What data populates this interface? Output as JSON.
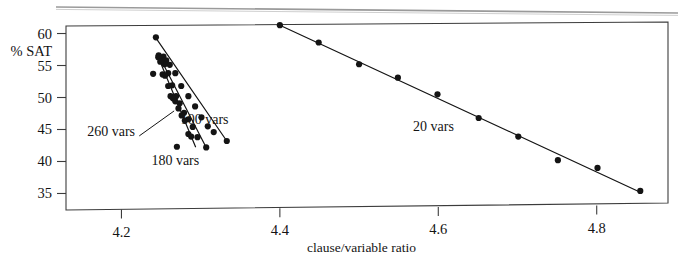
{
  "figure": {
    "name": "sat-vs-clause-variable-ratio-plot",
    "background": "#ffffff",
    "ink_color": "#141414"
  },
  "axes": {
    "x": {
      "label": "clause/variable ratio",
      "ticks": [
        "4.2",
        "4.4",
        "4.6",
        "4.8"
      ],
      "tick_values": [
        4.2,
        4.4,
        4.6,
        4.8
      ],
      "range": [
        4.13,
        4.89
      ]
    },
    "y": {
      "label": "% SAT",
      "ticks": [
        "60",
        "55",
        "50",
        "45",
        "40",
        "35"
      ],
      "tick_values": [
        60,
        55,
        50,
        45,
        40,
        35
      ],
      "range": [
        33.2,
        61.8
      ]
    }
  },
  "series_labels": [
    {
      "text": "100 vars",
      "x": 4.305,
      "y": 46.6
    },
    {
      "text": "260 vars",
      "x": 4.187,
      "y": 44.8
    },
    {
      "text": "180 vars",
      "x": 4.268,
      "y": 40.3
    },
    {
      "text": "20 vars",
      "x": 4.594,
      "y": 45.6
    }
  ],
  "chart_data": {
    "type": "scatter",
    "title": "",
    "xlabel": "clause/variable ratio",
    "ylabel": "% SAT",
    "xlim": [
      4.13,
      4.89
    ],
    "ylim": [
      33.2,
      61.8
    ],
    "grid": false,
    "legend": "inline-annotations",
    "series": [
      {
        "name": "20 vars",
        "marker": "filled-circle",
        "fit_line": {
          "x": [
            4.4,
            4.855
          ],
          "y": [
            61.3,
            35.2
          ]
        },
        "points": [
          {
            "x": 4.4,
            "y": 61.3
          },
          {
            "x": 4.449,
            "y": 58.6
          },
          {
            "x": 4.5,
            "y": 55.2
          },
          {
            "x": 4.549,
            "y": 53.1
          },
          {
            "x": 4.599,
            "y": 50.5
          },
          {
            "x": 4.651,
            "y": 46.8
          },
          {
            "x": 4.701,
            "y": 43.9
          },
          {
            "x": 4.751,
            "y": 40.2
          },
          {
            "x": 4.801,
            "y": 39.0
          },
          {
            "x": 4.855,
            "y": 35.4
          }
        ]
      },
      {
        "name": "100 vars",
        "marker": "filled-circle",
        "fit_line": {
          "x": [
            4.243,
            4.333
          ],
          "y": [
            59.4,
            43.2
          ]
        },
        "points": [
          {
            "x": 4.2435,
            "y": 59.4
          },
          {
            "x": 4.253,
            "y": 56.4
          },
          {
            "x": 4.2565,
            "y": 55.8
          },
          {
            "x": 4.261,
            "y": 55.1
          },
          {
            "x": 4.268,
            "y": 53.8
          },
          {
            "x": 4.2755,
            "y": 51.8
          },
          {
            "x": 4.2845,
            "y": 50.2
          },
          {
            "x": 4.293,
            "y": 48.6
          },
          {
            "x": 4.301,
            "y": 46.9
          },
          {
            "x": 4.309,
            "y": 45.5
          },
          {
            "x": 4.3165,
            "y": 44.6
          },
          {
            "x": 4.333,
            "y": 43.2
          }
        ]
      },
      {
        "name": "180 vars",
        "marker": "filled-circle",
        "fit_line": {
          "x": [
            4.247,
            4.307
          ],
          "y": [
            56.6,
            42.2
          ]
        },
        "points": [
          {
            "x": 4.247,
            "y": 56.6
          },
          {
            "x": 4.2505,
            "y": 55.9
          },
          {
            "x": 4.2545,
            "y": 55.2
          },
          {
            "x": 4.259,
            "y": 53.8
          },
          {
            "x": 4.264,
            "y": 51.9
          },
          {
            "x": 4.269,
            "y": 50.2
          },
          {
            "x": 4.2735,
            "y": 49.1
          },
          {
            "x": 4.279,
            "y": 47.6
          },
          {
            "x": 4.2845,
            "y": 46.6
          },
          {
            "x": 4.29,
            "y": 45.4
          },
          {
            "x": 4.296,
            "y": 43.8
          },
          {
            "x": 4.307,
            "y": 42.2
          }
        ]
      },
      {
        "name": "260 vars",
        "marker": "filled-circle",
        "fit_line": {
          "x": [
            4.2465,
            4.2935
          ],
          "y": [
            56.3,
            42.3
          ]
        },
        "points": [
          {
            "x": 4.24,
            "y": 53.7
          },
          {
            "x": 4.2465,
            "y": 56.3
          },
          {
            "x": 4.249,
            "y": 55.6
          },
          {
            "x": 4.252,
            "y": 53.6
          },
          {
            "x": 4.255,
            "y": 53.4
          },
          {
            "x": 4.259,
            "y": 51.8
          },
          {
            "x": 4.262,
            "y": 50.2
          },
          {
            "x": 4.265,
            "y": 49.9
          },
          {
            "x": 4.268,
            "y": 49.4
          },
          {
            "x": 4.272,
            "y": 48.3
          },
          {
            "x": 4.276,
            "y": 47.2
          },
          {
            "x": 4.28,
            "y": 46.4
          },
          {
            "x": 4.2845,
            "y": 44.3
          },
          {
            "x": 4.288,
            "y": 43.9
          },
          {
            "x": 4.27,
            "y": 42.3
          }
        ]
      }
    ]
  }
}
